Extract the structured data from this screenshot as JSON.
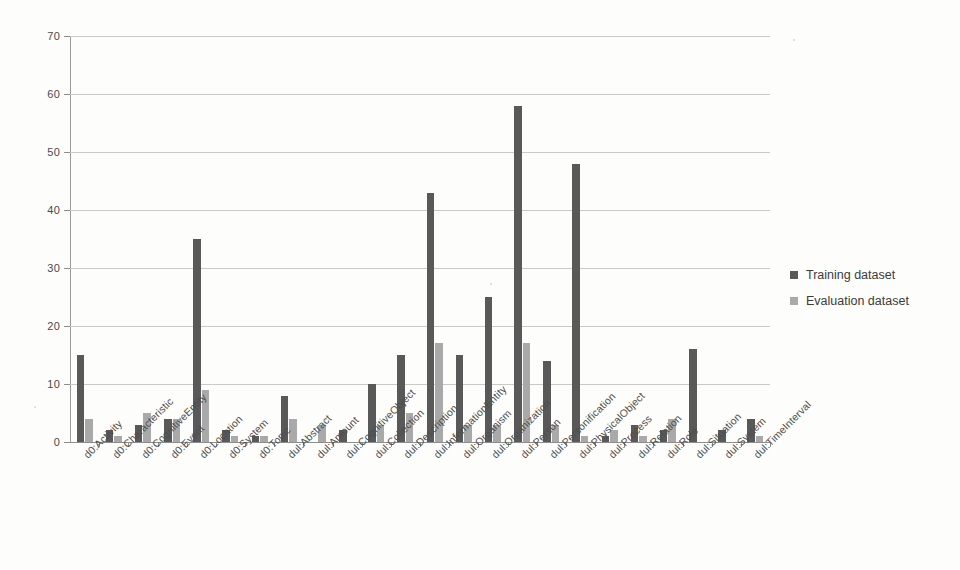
{
  "chart_data": {
    "type": "bar",
    "title": "",
    "xlabel": "",
    "ylabel": "",
    "ylim": [
      0,
      70
    ],
    "ytick_step": 10,
    "yticks": [
      "0",
      "10",
      "20",
      "30",
      "40",
      "50",
      "60",
      "70"
    ],
    "grid": true,
    "legend_position": "right",
    "colors": {
      "training": "#595959",
      "evaluation": "#a9a9a9",
      "gridline": "#c9c9c9",
      "axis": "#8d8d8d",
      "background": "#fdfdfc"
    },
    "categories": [
      "d0:Activity",
      "d0:Characteristic",
      "d0:CognitiveEntity",
      "d0:Event",
      "d0:Location",
      "d0:System",
      "d0:Topic",
      "dul:Abstract",
      "dul:Amount",
      "dul:CognitiveObject",
      "dul:Collection",
      "dul:Description",
      "dul:InformationEntity",
      "dul:Organism",
      "dul:Organization",
      "dul:Person",
      "dul:Personification",
      "dul:PhysicalObject",
      "dul:Process",
      "dul:Relation",
      "dul:Role",
      "dul:Situation",
      "dul:System",
      "dul:TimeInterval"
    ],
    "series": [
      {
        "name": "Training dataset",
        "color": "#595959",
        "values": [
          15,
          2,
          3,
          4,
          35,
          2,
          1,
          8,
          0,
          2,
          10,
          15,
          43,
          15,
          25,
          58,
          14,
          48,
          1,
          3,
          2,
          16,
          2,
          4
        ]
      },
      {
        "name": "Evaluation dataset",
        "color": "#a9a9a9",
        "values": [
          4,
          1,
          5,
          4,
          9,
          1,
          1,
          4,
          3,
          0,
          3,
          5,
          17,
          3,
          3,
          17,
          3,
          1,
          2,
          1,
          4,
          0,
          0,
          1
        ]
      }
    ]
  },
  "legend": {
    "entries": [
      {
        "label": "Training dataset",
        "key": "training"
      },
      {
        "label": "Evaluation dataset",
        "key": "evaluation"
      }
    ]
  }
}
